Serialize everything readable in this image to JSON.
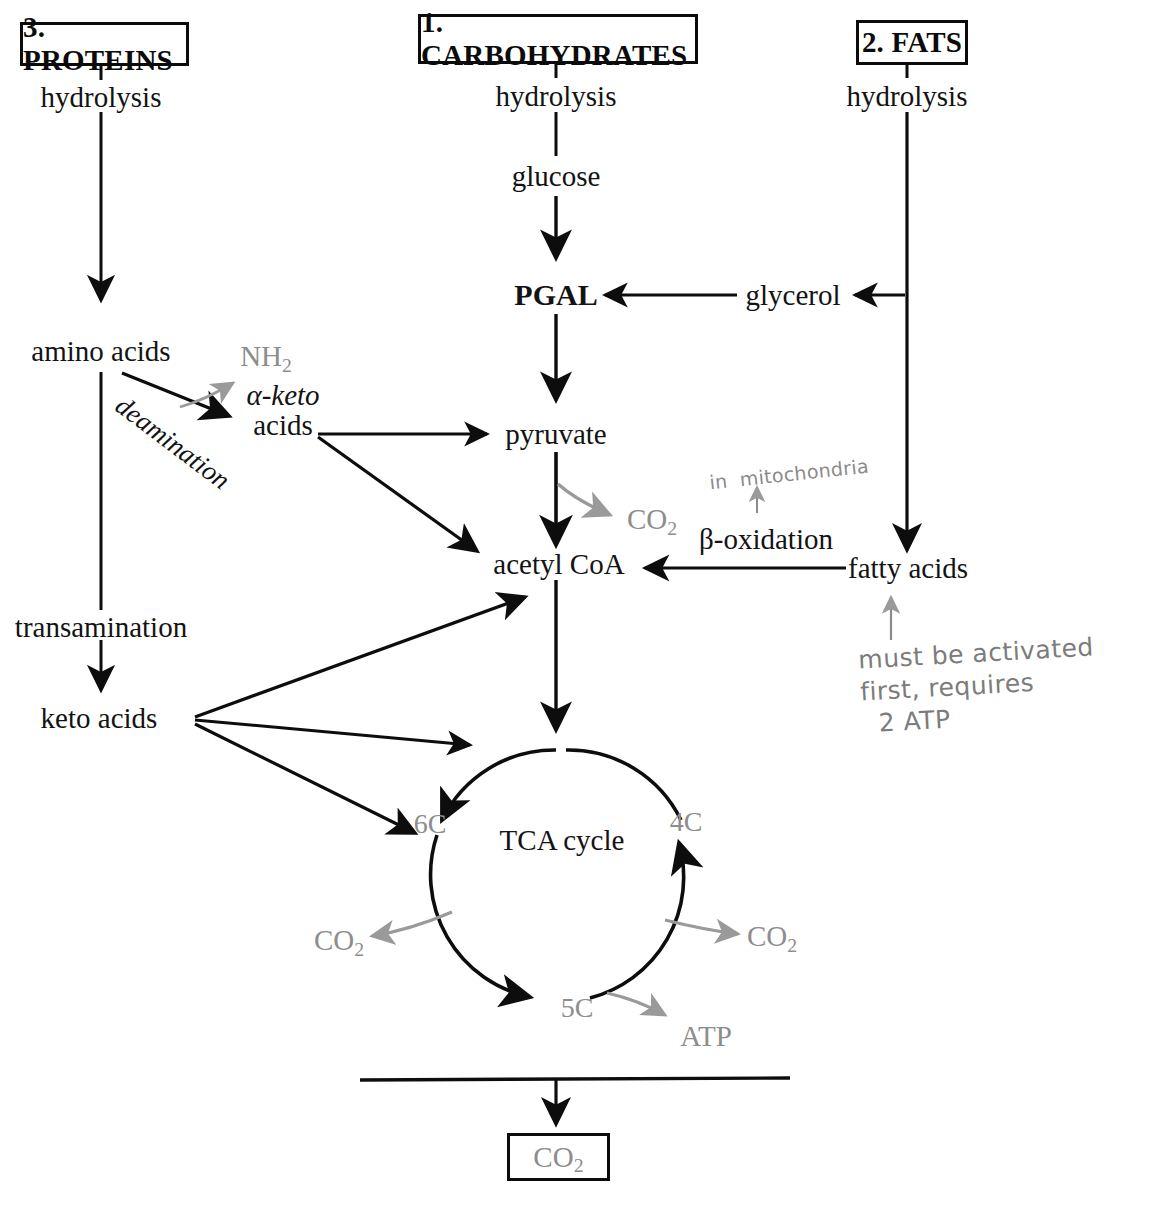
{
  "diagram": {
    "title_boxes": [
      {
        "id": "proteins",
        "label": "3. PROTEINS"
      },
      {
        "id": "carbohydrates",
        "label": "1. CARBOHYDRATES"
      },
      {
        "id": "fats",
        "label": "2. FATS"
      }
    ],
    "protein_branch": {
      "hydrolysis": "hydrolysis",
      "amino_acids": "amino acids",
      "deamination": "deamination",
      "nh2": "NH",
      "nh2_sub": "2",
      "keto_line1": "α-keto",
      "keto_line2": "acids",
      "transamination": "transamination",
      "keto_acids": "keto acids"
    },
    "carb_branch": {
      "hydrolysis": "hydrolysis",
      "glucose": "glucose",
      "pgal": "PGAL",
      "pyruvate": "pyruvate",
      "co2": "CO",
      "co2_sub": "2",
      "acetyl_coa": "acetyl CoA"
    },
    "fat_branch": {
      "hydrolysis": "hydrolysis",
      "glycerol": "glycerol",
      "fatty_acids": "fatty acids",
      "beta_oxidation": "β-oxidation"
    },
    "tca": {
      "center_label": "TCA cycle",
      "node_6c": "6C",
      "node_4c": "4C",
      "node_5c": "5C",
      "co2_left": "CO",
      "co2_left_sub": "2",
      "co2_right": "CO",
      "co2_right_sub": "2",
      "atp": "ATP"
    },
    "output": {
      "co2": "CO",
      "co2_sub": "2"
    },
    "handwritten_notes": [
      {
        "id": "mitochondria-note",
        "text": "in  mitochondria"
      },
      {
        "id": "activation-note",
        "text": "must be activated\nfirst, requires\n  2 ATP"
      }
    ],
    "colors": {
      "ink_black": "#131313",
      "gray_accent": "#8d8d8d",
      "handwriting": "#7c7c7c",
      "background": "#ffffff"
    }
  }
}
